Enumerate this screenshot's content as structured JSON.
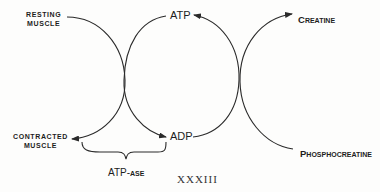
{
  "diagram": {
    "labels": {
      "resting_muscle": [
        "RESTING",
        "MUSCLE"
      ],
      "contracted_muscle": [
        "CONTRACTED",
        "MUSCLE"
      ],
      "atp": "ATP",
      "adp": "ADP",
      "creatine_first": "C",
      "creatine_rest": "REATINE",
      "phosphocreatine_first": "P",
      "phosphocreatine_rest": "HOSPHOCREATINE",
      "atpase_main": "ATP-",
      "atpase_suffix": "ASE"
    },
    "caption": "XXXIII",
    "stroke_color": "#2a2a2a",
    "nodes": [
      "Resting Muscle",
      "Contracted Muscle",
      "ATP",
      "ADP",
      "Creatine",
      "Phosphocreatine"
    ],
    "edges": [
      {
        "from": "Resting Muscle",
        "to": "Contracted Muscle"
      },
      {
        "from": "ATP",
        "to": "ADP"
      },
      {
        "from": "Phosphocreatine",
        "to": "Creatine"
      },
      {
        "from": "ADP",
        "to": "ATP"
      }
    ],
    "brace_label": "ATP-ase"
  }
}
